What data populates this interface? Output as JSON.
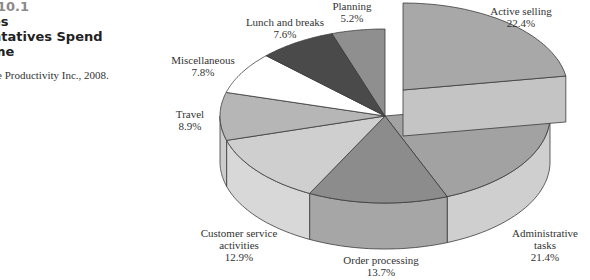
{
  "caption": {
    "figure_number": "10.1",
    "title_lines": [
      "es",
      "ntatives Spend",
      "me"
    ],
    "source": "e Productivity Inc., 2008."
  },
  "chart_data": {
    "type": "pie",
    "style": "3d-exploded",
    "exploded_slice": "Active selling",
    "start_angle": "12 o'clock, clockwise",
    "slices": [
      {
        "label": "Active selling",
        "value": 22.4,
        "value_label": "22.4%",
        "color": "#a8a8a8",
        "side_color": "#c4c4c4"
      },
      {
        "label": "Administrative tasks",
        "value": 21.4,
        "value_label": "21.4%",
        "color": "#a2a2a2",
        "side_color": "#cfcfcf"
      },
      {
        "label": "Order processing",
        "value": 13.7,
        "value_label": "13.7%",
        "color": "#8c8c8c",
        "side_color": "#a6a6a6"
      },
      {
        "label": "Customer service activities",
        "value": 12.9,
        "value_label": "12.9%",
        "color": "#cfcfcf",
        "side_color": "#d8d8d8"
      },
      {
        "label": "Travel",
        "value": 8.9,
        "value_label": "8.9%",
        "color": "#b6b6b6",
        "side_color": "#cccccc"
      },
      {
        "label": "Miscellaneous",
        "value": 7.8,
        "value_label": "7.8%",
        "color": "#ffffff",
        "side_color": "#ffffff"
      },
      {
        "label": "Lunch and breaks",
        "value": 7.6,
        "value_label": "7.6%",
        "color": "#4a4a4a",
        "side_color": "#4a4a4a"
      },
      {
        "label": "Planning",
        "value": 5.2,
        "value_label": "5.2%",
        "color": "#8f8f8f",
        "side_color": "#8f8f8f"
      }
    ]
  },
  "labels": {
    "active_selling": {
      "name": "Active selling",
      "pct": "22.4%"
    },
    "administrative": {
      "name1": "Administrative",
      "name2": "tasks",
      "pct": "21.4%"
    },
    "order_processing": {
      "name": "Order processing",
      "pct": "13.7%"
    },
    "customer_service": {
      "name1": "Customer service",
      "name2": "activities",
      "pct": "12.9%"
    },
    "travel": {
      "name": "Travel",
      "pct": "8.9%"
    },
    "miscellaneous": {
      "name": "Miscellaneous",
      "pct": "7.8%"
    },
    "lunch": {
      "name": "Lunch and breaks",
      "pct": "7.6%"
    },
    "planning": {
      "name": "Planning",
      "pct": "5.2%"
    }
  }
}
